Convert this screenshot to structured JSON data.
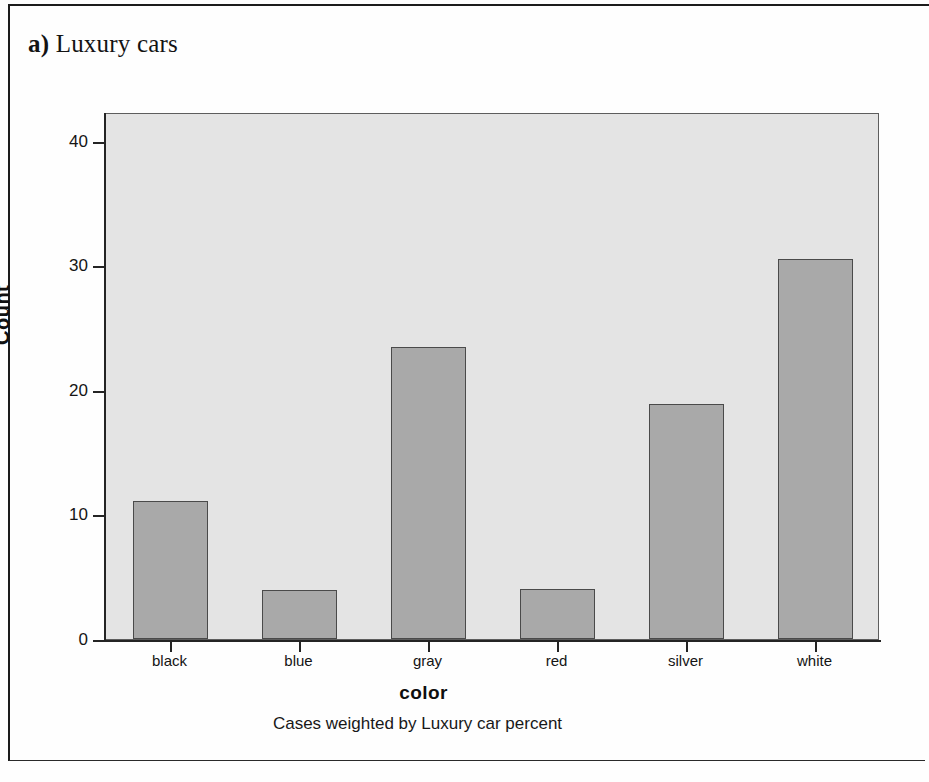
{
  "caption": {
    "marker": "a)",
    "text": "Luxury cars"
  },
  "chart_data": {
    "type": "bar",
    "title": "",
    "categories": [
      "black",
      "blue",
      "gray",
      "red",
      "silver",
      "white"
    ],
    "values": [
      11.1,
      3.9,
      23.4,
      4.0,
      18.9,
      30.5
    ],
    "xlabel": "color",
    "ylabel": "Count",
    "ylim": [
      0,
      42.3
    ],
    "yticks": [
      0,
      10,
      20,
      30,
      40
    ],
    "ytick_labels": [
      "0",
      "10",
      "20",
      "30",
      "40"
    ],
    "grid": false,
    "legend": false,
    "footnote": "Cases weighted by Luxury car percent",
    "bar_fill": "#a9a9a9",
    "bar_edge": "#4a4a4a",
    "plot_background": "#e4e4e4",
    "axis_color": "#242424"
  }
}
